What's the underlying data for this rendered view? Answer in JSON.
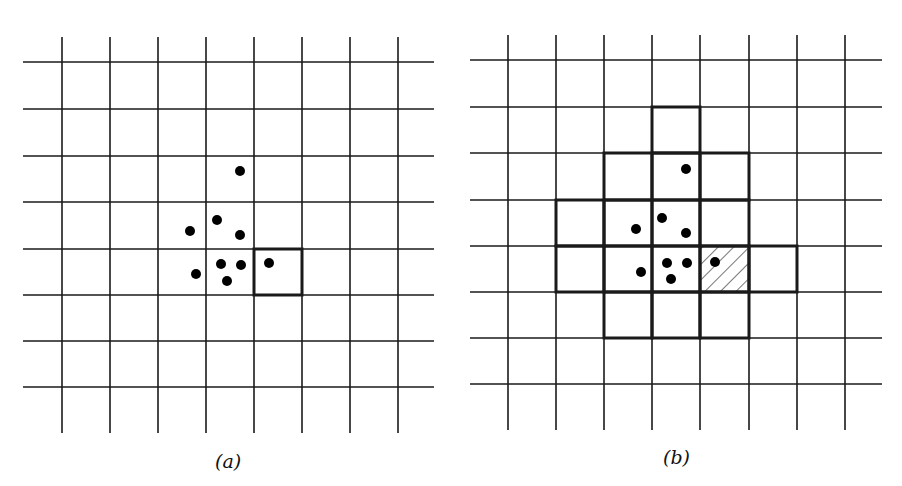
{
  "figure": {
    "panels": [
      {
        "id": "a",
        "caption": "(a)",
        "caption_pos": {
          "x": 215,
          "y": 450
        },
        "grid": {
          "vlines_x": [
            62,
            110,
            158,
            206,
            254,
            302,
            350,
            398
          ],
          "v_extent": [
            37,
            433
          ],
          "hlines_y": [
            62,
            109,
            156,
            202,
            249,
            295,
            341,
            387
          ],
          "h_extent": [
            23,
            434
          ]
        },
        "points": [
          [
            240,
            171
          ],
          [
            217,
            220
          ],
          [
            190,
            231
          ],
          [
            240,
            235
          ],
          [
            221,
            264
          ],
          [
            241,
            265
          ],
          [
            196,
            274
          ],
          [
            227,
            281
          ],
          [
            269,
            263
          ]
        ],
        "highlighted_cells": [
          {
            "x": 254,
            "y": 249,
            "w": 48,
            "h": 46,
            "style": "bold"
          }
        ]
      },
      {
        "id": "b",
        "caption": "(b)",
        "caption_pos": {
          "x": 663,
          "y": 446
        },
        "grid": {
          "vlines_x": [
            508,
            556,
            604,
            652,
            700,
            749,
            797,
            845
          ],
          "v_extent": [
            35,
            430
          ],
          "hlines_y": [
            60,
            107,
            153,
            200,
            246,
            292,
            338,
            384
          ],
          "h_extent": [
            470,
            882
          ]
        },
        "points": [
          [
            686,
            169
          ],
          [
            662,
            218
          ],
          [
            636,
            229
          ],
          [
            686,
            233
          ],
          [
            667,
            263
          ],
          [
            687,
            263
          ],
          [
            641,
            272
          ],
          [
            671,
            279
          ],
          [
            715,
            262
          ]
        ],
        "highlighted_cells": [
          {
            "x": 652,
            "y": 107,
            "w": 48,
            "h": 46,
            "style": "bold"
          },
          {
            "x": 604,
            "y": 153,
            "w": 48,
            "h": 47,
            "style": "bold"
          },
          {
            "x": 652,
            "y": 153,
            "w": 48,
            "h": 47,
            "style": "bold"
          },
          {
            "x": 700,
            "y": 153,
            "w": 49,
            "h": 47,
            "style": "bold"
          },
          {
            "x": 556,
            "y": 200,
            "w": 48,
            "h": 46,
            "style": "bold"
          },
          {
            "x": 604,
            "y": 200,
            "w": 48,
            "h": 46,
            "style": "bold"
          },
          {
            "x": 652,
            "y": 200,
            "w": 48,
            "h": 46,
            "style": "bold"
          },
          {
            "x": 700,
            "y": 200,
            "w": 49,
            "h": 46,
            "style": "bold"
          },
          {
            "x": 556,
            "y": 246,
            "w": 48,
            "h": 46,
            "style": "bold"
          },
          {
            "x": 604,
            "y": 246,
            "w": 48,
            "h": 46,
            "style": "bold"
          },
          {
            "x": 652,
            "y": 246,
            "w": 48,
            "h": 46,
            "style": "bold"
          },
          {
            "x": 700,
            "y": 246,
            "w": 49,
            "h": 46,
            "style": "hatched"
          },
          {
            "x": 749,
            "y": 246,
            "w": 48,
            "h": 46,
            "style": "bold"
          },
          {
            "x": 604,
            "y": 292,
            "w": 48,
            "h": 46,
            "style": "bold"
          },
          {
            "x": 652,
            "y": 292,
            "w": 48,
            "h": 46,
            "style": "bold"
          },
          {
            "x": 700,
            "y": 292,
            "w": 49,
            "h": 46,
            "style": "bold"
          }
        ]
      }
    ],
    "colors": {
      "line": "#1a1a1a",
      "point": "#000000",
      "background": "#ffffff"
    }
  }
}
